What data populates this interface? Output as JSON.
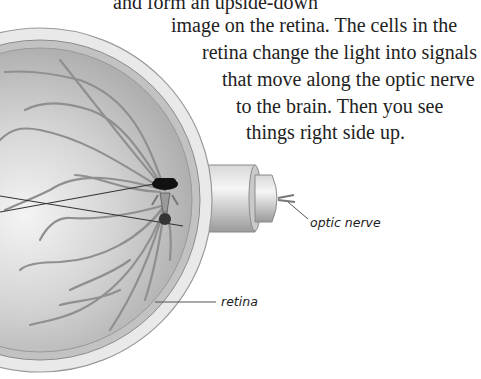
{
  "body_text": {
    "lines": [
      "and form an upside-down",
      "image on the retina. The cells in the",
      "retina change the light into signals",
      "that move along the optic nerve",
      "to the brain. Then you see",
      "things right side up."
    ]
  },
  "diagram": {
    "labels": {
      "optic_nerve": "optic nerve",
      "retina": "retina"
    }
  }
}
